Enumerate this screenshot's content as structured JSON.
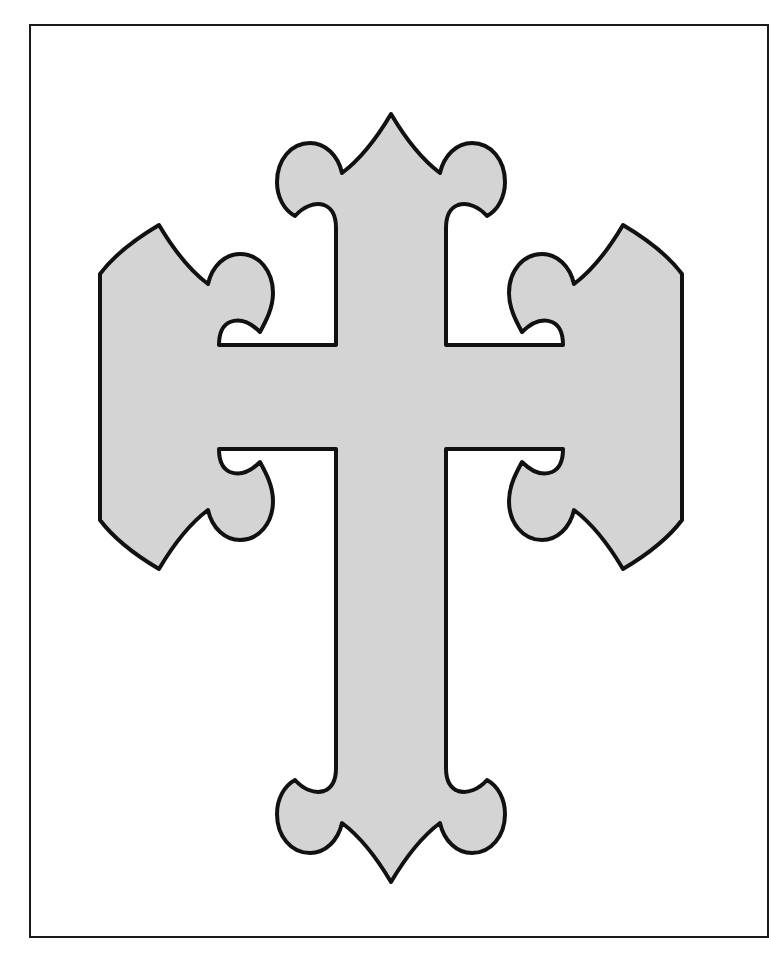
{
  "document": {
    "kind": "coloring-page",
    "page_background": "#ffffff"
  },
  "page_frame": {
    "name": "page-border",
    "stroke_color": "#1a1a1a",
    "stroke_width": 2,
    "left": 29,
    "top": 24,
    "bottom": 938,
    "right_clipped": true
  },
  "artwork": {
    "title": "Budded Cross Outline",
    "shape_name": "cross",
    "style": "fleur-de-lis terminals",
    "fill_color": "#d4d4d4",
    "stroke_color": "#111111",
    "stroke_width": 4,
    "geometry": {
      "center_x": 391,
      "cross_bar_y": 397,
      "shaft_left": 337,
      "shaft_right": 446,
      "arm_top": 345,
      "arm_bottom": 448,
      "top_tip_y": 114,
      "bottom_tip_y": 872,
      "left_tip_x": 100,
      "right_tip_x": 682,
      "top_lobe_left_x": 295,
      "top_lobe_right_x": 488,
      "arm_lobe_top_y": 305,
      "arm_lobe_bottom_y": 490
    },
    "terminals": [
      {
        "name": "top-finial",
        "direction": "up",
        "tip": [
          391,
          114
        ]
      },
      {
        "name": "left-finial",
        "direction": "left",
        "tip": [
          100,
          397
        ]
      },
      {
        "name": "right-finial",
        "direction": "right",
        "tip": [
          682,
          397
        ]
      },
      {
        "name": "bottom-finial",
        "direction": "down",
        "tip": [
          391,
          872
        ]
      }
    ]
  }
}
